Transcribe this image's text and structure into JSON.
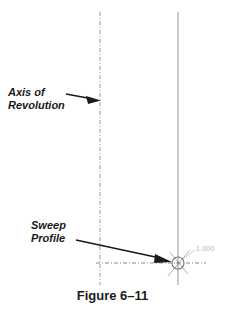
{
  "figure": {
    "caption": "Figure 6–11",
    "background_color": "#ffffff"
  },
  "callouts": [
    {
      "id": "axis-of-revolution",
      "line1": "Axis of",
      "line2": "Revolution",
      "text": "Axis of Revolution",
      "color": "#1a1a1a",
      "leader_from": [
        68,
        95
      ],
      "leader_to": [
        100,
        100
      ],
      "arrow_target": "axis-of-revolution-centerline"
    },
    {
      "id": "sweep-profile",
      "line1": "Sweep",
      "line2": "Profile",
      "text": "Sweep Profile",
      "color": "#1a1a1a",
      "leader_from": [
        78,
        240
      ],
      "leader_to": [
        172,
        262
      ],
      "arrow_target": "sweep-profile-marker"
    }
  ],
  "geometry": {
    "axis_of_revolution_line": {
      "name": "axis-of-revolution-centerline",
      "x": 100,
      "y_start": 12,
      "y_end": 285,
      "style": "center-dashed",
      "color": "#9a9a9a"
    },
    "profile_axis_line": {
      "name": "profile-vertical-centerline",
      "x": 178,
      "y_start": 12,
      "y_end": 285,
      "style": "solid",
      "color": "#b0b0b0"
    },
    "horizontal_centerline": {
      "name": "horizontal-centerline",
      "y": 263,
      "x_start": 96,
      "x_end": 206,
      "style": "center-dashed",
      "color": "#8c8c8c"
    },
    "sweep_profile_marker": {
      "name": "sweep-profile-marker",
      "cx": 178,
      "cy": 263,
      "radius": 6,
      "color": "#8c8c8c",
      "shape": "circle-with-crosshair"
    },
    "dimension_leader": {
      "name": "dimension-leader-line",
      "from": [
        183,
        259
      ],
      "to": [
        196,
        250
      ],
      "color": "#c0c0c0"
    }
  },
  "dimension": {
    "name": "diameter-dimension-value",
    "value": "1.000",
    "color": "#b4b4b4"
  }
}
